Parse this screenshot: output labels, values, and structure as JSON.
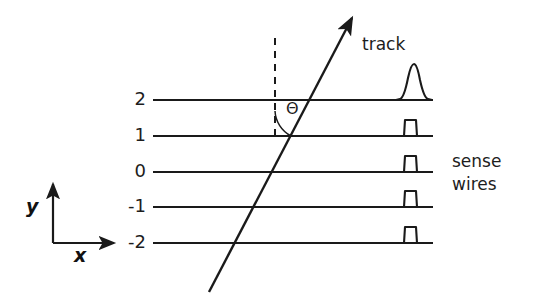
{
  "figure": {
    "background_color": "#ffffff",
    "line_color": "#1a1a1a"
  },
  "axes": {
    "x_label": "x",
    "y_label": "y",
    "origin": {
      "x": 53,
      "y": 243
    },
    "x_arrow_end": {
      "x": 120,
      "y": 243
    },
    "y_arrow_end": {
      "x": 53,
      "y": 178
    }
  },
  "wires": [
    {
      "label": "2",
      "y_value": 2,
      "py": 100,
      "x_start": 153,
      "x_end": 433,
      "pulse": "wide"
    },
    {
      "label": "1",
      "y_value": 1,
      "py": 136,
      "x_start": 153,
      "x_end": 433,
      "pulse": "narrow"
    },
    {
      "label": "0",
      "y_value": 0,
      "py": 172,
      "x_start": 153,
      "x_end": 433,
      "pulse": "narrow"
    },
    {
      "label": "-1",
      "y_value": -1,
      "py": 207,
      "x_start": 153,
      "x_end": 433,
      "pulse": "narrow"
    },
    {
      "label": "-2",
      "y_value": -2,
      "py": 243,
      "x_start": 153,
      "x_end": 433,
      "pulse": "narrow"
    }
  ],
  "track": {
    "label": "track",
    "start": {
      "x": 209,
      "y": 292
    },
    "end": {
      "x": 355,
      "y": 14
    },
    "label_position": {
      "x": 362,
      "y": 45
    }
  },
  "reference_line": {
    "name": "vertical-dashed-reference",
    "x": 275,
    "y_top": 38,
    "y_bottom": 141,
    "dash_pattern": "7 6"
  },
  "angle": {
    "symbol": "Θ",
    "label_position": {
      "x": 292,
      "y": 108
    },
    "arc_center": {
      "x": 275,
      "y": 141
    },
    "arc_radius": 30
  },
  "annotations": {
    "sense_wires_line1": "sense",
    "sense_wires_line2": "wires",
    "sense_wires_position": {
      "x": 452,
      "y": 158
    }
  },
  "pulses": {
    "wide": {
      "base_width": 34,
      "height": 36,
      "description": "broad peaked pulse on wire y=2"
    },
    "narrow": {
      "base_width": 20,
      "height": 20,
      "description": "narrow square pulse"
    }
  }
}
